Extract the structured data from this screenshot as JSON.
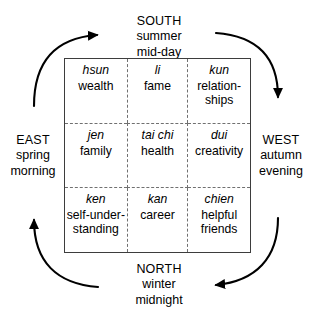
{
  "colors": {
    "text": "#000000",
    "box_border": "#3d3d3d",
    "divider": "#707070",
    "arrow": "#000000",
    "background": "#ffffff"
  },
  "compass": {
    "south": {
      "direction": "SOUTH",
      "season": "summer",
      "time": "mid-day"
    },
    "north": {
      "direction": "NORTH",
      "season": "winter",
      "time": "midnight"
    },
    "east": {
      "direction": "EAST",
      "season": "spring",
      "time": "morning"
    },
    "west": {
      "direction": "WEST",
      "season": "autumn",
      "time": "evening"
    }
  },
  "grid": {
    "rows": 3,
    "columns": 3,
    "cells": [
      {
        "trigram": "hsun",
        "meaning": "wealth",
        "position": "top-left"
      },
      {
        "trigram": "li",
        "meaning": "fame",
        "position": "top-center"
      },
      {
        "trigram": "kun",
        "meaning": "relation-\nships",
        "position": "top-right"
      },
      {
        "trigram": "jen",
        "meaning": "family",
        "position": "middle-left"
      },
      {
        "trigram": "tai chi",
        "meaning": "health",
        "position": "middle-center"
      },
      {
        "trigram": "dui",
        "meaning": "creativity",
        "position": "middle-right"
      },
      {
        "trigram": "ken",
        "meaning": "self-under-\nstanding",
        "position": "bottom-left"
      },
      {
        "trigram": "kan",
        "meaning": "career",
        "position": "bottom-center"
      },
      {
        "trigram": "chien",
        "meaning": "helpful\nfriends",
        "position": "bottom-right"
      }
    ]
  },
  "arrows": [
    {
      "name": "arrow-east-to-south",
      "from": "east",
      "to": "south",
      "direction": "right",
      "corner": "top-left"
    },
    {
      "name": "arrow-south-to-west",
      "from": "south",
      "to": "west",
      "direction": "down",
      "corner": "top-right"
    },
    {
      "name": "arrow-west-to-north",
      "from": "west",
      "to": "north",
      "direction": "left",
      "corner": "bottom-right"
    },
    {
      "name": "arrow-north-to-east",
      "from": "north",
      "to": "east",
      "direction": "up",
      "corner": "bottom-left"
    }
  ]
}
